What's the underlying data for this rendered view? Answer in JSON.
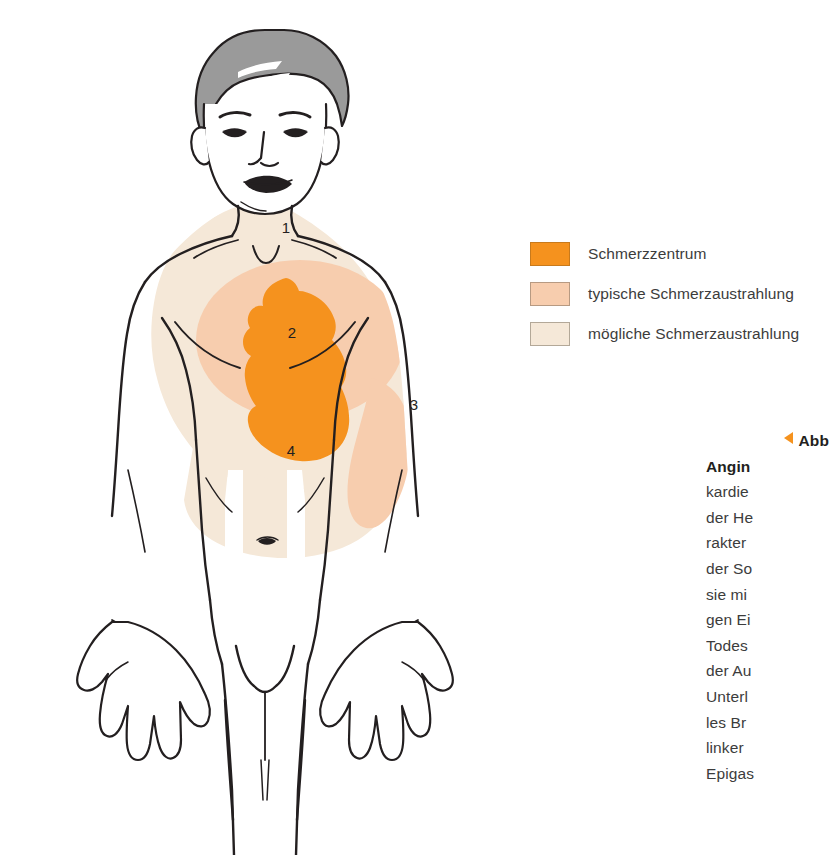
{
  "figure": {
    "colors": {
      "pain_center": "#F5921E",
      "typical_radiation": "#F7CDAE",
      "possible_radiation": "#F5E8D8",
      "skin": "#FFFFFF",
      "hair": "#9A9A9A",
      "outline": "#231f20",
      "accent": "#F5921E"
    },
    "zone_labels": [
      {
        "id": "1",
        "text": "1",
        "x": 286,
        "y": 229
      },
      {
        "id": "2",
        "text": "2",
        "x": 292,
        "y": 334
      },
      {
        "id": "3",
        "text": "3",
        "x": 414,
        "y": 406
      },
      {
        "id": "4",
        "text": "4",
        "x": 291,
        "y": 452
      }
    ]
  },
  "legend": {
    "items": [
      {
        "label": "Schmerzzentrum",
        "swatch": "#F5921E",
        "border": "#C87A1C"
      },
      {
        "label": "typische Schmerzaustrahlung",
        "swatch": "#F7CDAE",
        "border": "#B79A82"
      },
      {
        "label": "mögliche Schmerzaustrahlung",
        "swatch": "#F5E8D8",
        "border": "#B3A898"
      }
    ]
  },
  "caption": {
    "marker_label": "Abb",
    "lines": [
      {
        "text": "Abb",
        "bold": true,
        "marker": true
      },
      {
        "text": "Angin",
        "bold": true,
        "marker": false
      },
      {
        "text": "kardie",
        "bold": false,
        "marker": false
      },
      {
        "text": "der He",
        "bold": false,
        "marker": false
      },
      {
        "text": "rakter",
        "bold": false,
        "marker": false
      },
      {
        "text": "der So",
        "bold": false,
        "marker": false
      },
      {
        "text": "sie mi",
        "bold": false,
        "marker": false
      },
      {
        "text": "gen Ei",
        "bold": false,
        "marker": false
      },
      {
        "text": "Todes",
        "bold": false,
        "marker": false
      },
      {
        "text": "der Au",
        "bold": false,
        "marker": false
      },
      {
        "text": "Unterl",
        "bold": false,
        "marker": false
      },
      {
        "text": "les Br",
        "bold": false,
        "marker": false
      },
      {
        "text": "linker",
        "bold": false,
        "marker": false
      },
      {
        "text": "Epigas",
        "bold": false,
        "marker": false
      }
    ]
  }
}
